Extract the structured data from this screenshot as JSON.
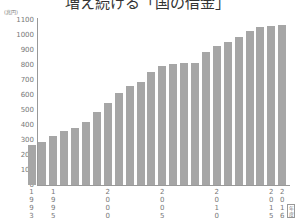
{
  "title": "増え続ける「国の借金」",
  "unit_label": "(兆円)",
  "xunit_label": "年度",
  "chart_data": {
    "type": "bar",
    "title": "増え続ける「国の借金」",
    "xlabel": "(年度)",
    "ylabel": "(兆円)",
    "ylim": [
      0,
      1100
    ],
    "yticks": [
      0,
      100,
      200,
      300,
      400,
      500,
      600,
      700,
      800,
      900,
      1000,
      1100
    ],
    "grid": false,
    "categories": [
      "1993",
      "1994",
      "1995",
      "1996",
      "1997",
      "1998",
      "1999",
      "2000",
      "2001",
      "2002",
      "2003",
      "2004",
      "2005",
      "2006",
      "2007",
      "2008",
      "2009",
      "2010",
      "2011",
      "2012",
      "2013",
      "2014",
      "2015",
      "2016"
    ],
    "values": [
      267,
      287,
      327,
      360,
      380,
      420,
      487,
      547,
      613,
      660,
      687,
      753,
      793,
      807,
      813,
      813,
      887,
      927,
      953,
      987,
      1027,
      1053,
      1060,
      1067
    ],
    "xtick_labels": {
      "0": "1993",
      "2": "1995",
      "7": "2000",
      "12": "2005",
      "17": "2010",
      "22": "2015",
      "23": "2016"
    },
    "bar_color": "#a6a6a6"
  }
}
